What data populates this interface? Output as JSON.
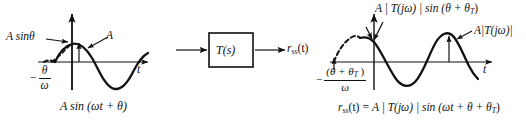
{
  "figure": {
    "background_color": "#ffffff",
    "ink_color": "#111111"
  },
  "input_plot": {
    "name": "input-sinusoid-plot",
    "axis_label_t": "t",
    "amplitude_label": "A",
    "offset_label": "A  sinθ",
    "phase_shift_minus": "−",
    "phase_shift_numerator": "θ",
    "phase_shift_denominator": "ω",
    "caption": "A  sin (ωt + θ)"
  },
  "block": {
    "name": "transfer-function-block",
    "label": "T(s)",
    "input_arrow": "input-arrow",
    "output_arrow": "output-arrow",
    "output_label_base": "r",
    "output_label_sub": "ss",
    "output_label_arg": "(t)"
  },
  "output_plot": {
    "name": "output-sinusoid-plot",
    "axis_label_t": "t",
    "peak_label": "A|T(jω)|",
    "offset_label": "A | T(jω) | sin (θ + θ",
    "offset_label_sub": "T",
    "offset_label_tail": ")",
    "phase_shift_minus": "−",
    "phase_shift_numerator_open": "(θ + θ",
    "phase_shift_numerator_sub": "T",
    "phase_shift_numerator_close": " )",
    "phase_shift_denominator": "ω"
  },
  "equation": {
    "name": "steady-state-response-equation",
    "lhs_base": "r",
    "lhs_sub": "ss",
    "lhs_arg": "(t)",
    "equals": "=",
    "rhs": "A | T(jω) | sin (ωt + θ + θ",
    "rhs_sub": "T",
    "rhs_tail": ")"
  }
}
